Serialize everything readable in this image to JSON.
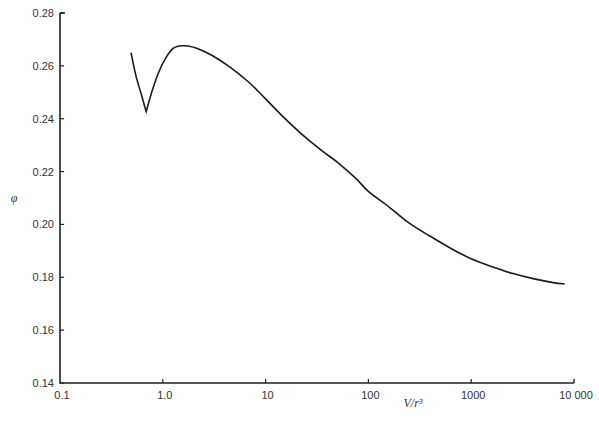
{
  "chart_data": {
    "type": "line",
    "title": "",
    "xlabel": "V/r³",
    "ylabel": "φ",
    "xscale": "log",
    "xlim": [
      0.1,
      10000
    ],
    "ylim": [
      0.14,
      0.28
    ],
    "grid": false,
    "legend": null,
    "xticks": [
      {
        "value": 0.1,
        "label": "0.1"
      },
      {
        "value": 1,
        "label": "1.0"
      },
      {
        "value": 10,
        "label": "10"
      },
      {
        "value": 100,
        "label": "100"
      },
      {
        "value": 1000,
        "label": "1000"
      },
      {
        "value": 10000,
        "label": "10 000"
      }
    ],
    "yticks": [
      {
        "value": 0.14,
        "label": "0.14"
      },
      {
        "value": 0.16,
        "label": "0.16"
      },
      {
        "value": 0.18,
        "label": "0.18"
      },
      {
        "value": 0.2,
        "label": "0.20"
      },
      {
        "value": 0.22,
        "label": "0.22"
      },
      {
        "value": 0.24,
        "label": "0.24"
      },
      {
        "value": 0.26,
        "label": "0.26"
      },
      {
        "value": 0.28,
        "label": "0.28"
      }
    ],
    "series": [
      {
        "name": "phi",
        "color": "#1a1a1a",
        "x": [
          0.49,
          0.55,
          0.62,
          0.69,
          0.78,
          0.9,
          1.05,
          1.25,
          1.45,
          1.75,
          2.2,
          3.0,
          4.5,
          7.0,
          10,
          15,
          22,
          35,
          50,
          75,
          100,
          160,
          250,
          400,
          630,
          1000,
          1600,
          2500,
          4000,
          6300,
          8100
        ],
        "y": [
          0.265,
          0.256,
          0.249,
          0.2427,
          0.25,
          0.257,
          0.2625,
          0.2665,
          0.2675,
          0.2675,
          0.2665,
          0.264,
          0.2595,
          0.2535,
          0.2475,
          0.2405,
          0.2345,
          0.228,
          0.2235,
          0.2175,
          0.2125,
          0.2065,
          0.2005,
          0.1955,
          0.191,
          0.187,
          0.184,
          0.1815,
          0.1795,
          0.178,
          0.1775
        ]
      }
    ]
  }
}
